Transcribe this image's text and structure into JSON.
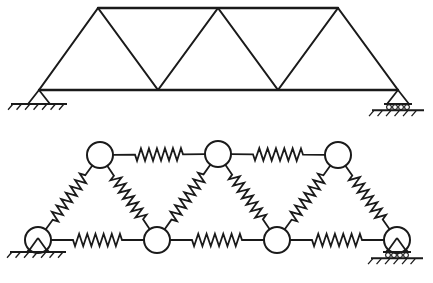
{
  "figure": {
    "background_color": "#ffffff",
    "line_color": "#1a1a1a",
    "width": 433,
    "height": 283,
    "panels": [
      {
        "id": "truss",
        "label": "pin-jointed truss"
      },
      {
        "id": "spring-model",
        "label": "spring network analogue"
      }
    ]
  },
  "truss": {
    "label": "warren-truss",
    "top_chord_y": 8,
    "bottom_chord_y": 90,
    "top_nodes": [
      {
        "name": "T1",
        "x": 98,
        "y": 8
      },
      {
        "name": "T2",
        "x": 218,
        "y": 8
      },
      {
        "name": "T3",
        "x": 338,
        "y": 8
      }
    ],
    "bottom_nodes": [
      {
        "name": "B1",
        "x": 39,
        "y": 90
      },
      {
        "name": "B2",
        "x": 158,
        "y": 90
      },
      {
        "name": "B3",
        "x": 278,
        "y": 90
      },
      {
        "name": "B4",
        "x": 398,
        "y": 90
      }
    ],
    "chords": [
      {
        "name": "top-chord",
        "from": "T1",
        "to": "T3"
      },
      {
        "name": "bottom-chord",
        "from": "B1",
        "to": "B4"
      }
    ],
    "diagonals": [
      {
        "name": "d1",
        "from": "B1",
        "to": "T1"
      },
      {
        "name": "d2",
        "from": "T1",
        "to": "B2"
      },
      {
        "name": "d3",
        "from": "B2",
        "to": "T2"
      },
      {
        "name": "d4",
        "from": "T2",
        "to": "B3"
      },
      {
        "name": "d5",
        "from": "B3",
        "to": "T3"
      },
      {
        "name": "d6",
        "from": "T3",
        "to": "B4"
      }
    ],
    "supports": [
      {
        "name": "left-pin-support",
        "type": "pinned",
        "x": 39,
        "y": 90
      },
      {
        "name": "right-roller-support",
        "type": "roller",
        "x": 398,
        "y": 90
      }
    ]
  },
  "spring_model": {
    "label": "spring-network",
    "node_radius": 13,
    "top_masses": [
      {
        "name": "M-top-1",
        "x": 100,
        "y": 155
      },
      {
        "name": "M-top-2",
        "x": 218,
        "y": 154
      },
      {
        "name": "M-top-3",
        "x": 338,
        "y": 155
      }
    ],
    "bottom_masses": [
      {
        "name": "M-bot-1",
        "x": 38,
        "y": 240
      },
      {
        "name": "M-bot-2",
        "x": 157,
        "y": 240
      },
      {
        "name": "M-bot-3",
        "x": 277,
        "y": 240
      },
      {
        "name": "M-bot-4",
        "x": 397,
        "y": 240
      }
    ],
    "top_springs": [
      {
        "name": "spring-top-1",
        "from": "M-top-1",
        "to": "M-top-2",
        "coils": 6
      },
      {
        "name": "spring-top-2",
        "from": "M-top-2",
        "to": "M-top-3",
        "coils": 6
      }
    ],
    "bottom_springs": [
      {
        "name": "spring-bot-1",
        "from": "M-bot-1",
        "to": "M-bot-2",
        "coils": 6
      },
      {
        "name": "spring-bot-2",
        "from": "M-bot-2",
        "to": "M-bot-3",
        "coils": 6
      },
      {
        "name": "spring-bot-3",
        "from": "M-bot-3",
        "to": "M-bot-4",
        "coils": 6
      }
    ],
    "diagonal_springs": [
      {
        "name": "spring-diag-1",
        "from": "M-bot-1",
        "to": "M-top-1",
        "coils": 7
      },
      {
        "name": "spring-diag-2",
        "from": "M-top-1",
        "to": "M-bot-2",
        "coils": 7
      },
      {
        "name": "spring-diag-3",
        "from": "M-bot-2",
        "to": "M-top-2",
        "coils": 7
      },
      {
        "name": "spring-diag-4",
        "from": "M-top-2",
        "to": "M-bot-3",
        "coils": 7
      },
      {
        "name": "spring-diag-5",
        "from": "M-bot-3",
        "to": "M-top-3",
        "coils": 7
      },
      {
        "name": "spring-diag-6",
        "from": "M-top-3",
        "to": "M-bot-4",
        "coils": 7
      }
    ],
    "supports": [
      {
        "name": "left-pin-support",
        "type": "pinned",
        "x": 38,
        "y": 240
      },
      {
        "name": "right-roller-support",
        "type": "roller",
        "x": 397,
        "y": 240
      }
    ]
  }
}
